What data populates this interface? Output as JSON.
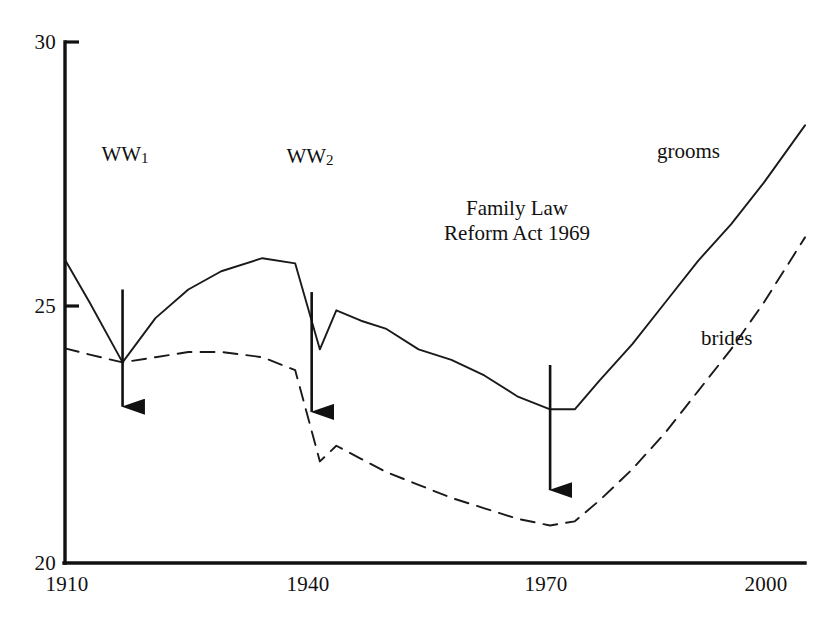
{
  "chart_data": {
    "type": "line",
    "title": "",
    "subtitle": "",
    "xlabel": "",
    "ylabel": "",
    "xlim": [
      1910,
      2000
    ],
    "ylim": [
      20,
      30
    ],
    "grid": false,
    "legend_position": "inline-right",
    "x_ticks": [
      "1910",
      "1940",
      "1970",
      "2000"
    ],
    "x_tick_values": [
      1910,
      1940,
      1970,
      2000
    ],
    "y_ticks": [
      "20",
      "25",
      "30"
    ],
    "y_tick_values": [
      20,
      25,
      30
    ],
    "series": [
      {
        "name": "grooms",
        "style": "solid",
        "color": "#1a1a1a",
        "x": [
          1910,
          1913,
          1917,
          1921,
          1925,
          1929,
          1934,
          1938,
          1941,
          1943,
          1946,
          1949,
          1953,
          1957,
          1961,
          1965,
          1969,
          1972,
          1975,
          1979,
          1983,
          1987,
          1991,
          1995,
          2000
        ],
        "values": [
          25.82,
          25.0,
          23.85,
          24.7,
          25.25,
          25.6,
          25.85,
          25.75,
          24.1,
          24.85,
          24.65,
          24.5,
          24.1,
          23.9,
          23.6,
          23.2,
          22.95,
          22.95,
          23.5,
          24.2,
          25.0,
          25.8,
          26.5,
          27.3,
          28.4
        ]
      },
      {
        "name": "brides",
        "style": "dashed",
        "color": "#1a1a1a",
        "x": [
          1910,
          1913,
          1917,
          1921,
          1925,
          1929,
          1934,
          1938,
          1941,
          1943,
          1946,
          1949,
          1953,
          1957,
          1961,
          1965,
          1969,
          1972,
          1975,
          1979,
          1983,
          1987,
          1991,
          1995,
          2000
        ],
        "values": [
          24.12,
          24.0,
          23.85,
          23.95,
          24.05,
          24.05,
          23.95,
          23.7,
          21.95,
          22.25,
          22.0,
          21.75,
          21.5,
          21.25,
          21.05,
          20.85,
          20.72,
          20.8,
          21.2,
          21.8,
          22.5,
          23.3,
          24.1,
          25.0,
          26.25
        ]
      }
    ],
    "annotations": [
      {
        "id": "ww1",
        "label_main": "WW",
        "label_sub": "1",
        "x_value": 1917,
        "arrow_from": 25.25,
        "arrow_to": 23.0
      },
      {
        "id": "ww2",
        "label_main": "WW",
        "label_sub": "2",
        "x_value": 1940,
        "arrow_from": 25.2,
        "arrow_to": 22.9
      },
      {
        "id": "family-law-reform-act",
        "label_line1": "Family Law",
        "label_line2": "Reform Act 1969",
        "x_value": 1969,
        "arrow_from": 23.8,
        "arrow_to": 21.4
      }
    ]
  },
  "axis": {
    "y_labels": [
      "30",
      "25",
      "20"
    ],
    "x_labels": [
      "1910",
      "1940",
      "1970",
      "2000"
    ]
  },
  "annotations": {
    "ww1": {
      "main": "WW",
      "sub": "1"
    },
    "ww2": {
      "main": "WW",
      "sub": "2"
    },
    "family_law": {
      "line1": "Family Law",
      "line2": "Reform Act 1969"
    }
  },
  "series_labels": {
    "grooms": "grooms",
    "brides": "brides"
  },
  "colors": {
    "line": "#1a1a1a",
    "axis": "#111111",
    "background": "#ffffff",
    "text": "#111111"
  }
}
